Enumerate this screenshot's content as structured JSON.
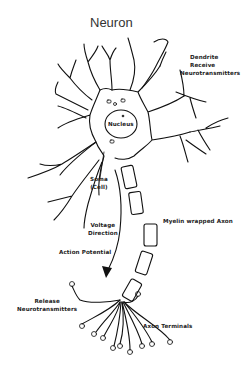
{
  "title": "Neuron",
  "labels": {
    "dendrite": [
      "Dendrite",
      "Receive",
      "Neurotransmitters"
    ],
    "nucleus": "Nucleus",
    "soma": [
      "Soma",
      "(Cell)"
    ],
    "voltage_direction": [
      "Voltage",
      "Direction"
    ],
    "action_potential": "Action Potential",
    "myelin": "Myelin wrapped Axon",
    "release": [
      "Release",
      "Neurotransmitters"
    ],
    "axon_terminals": "Axon Terminals"
  },
  "colors": {
    "background": "#ffffff",
    "line": "#111111",
    "text": "#222222"
  }
}
